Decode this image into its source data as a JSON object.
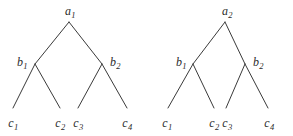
{
  "figure": {
    "type": "diagram",
    "background_color": "#ffffff",
    "line_color": "#3a3a3a",
    "text_color": "#2b2b2b",
    "width": 293,
    "height": 136
  },
  "trees": [
    {
      "id": "left-tree",
      "root": {
        "label": "a",
        "sub": "1",
        "x": 69,
        "y": 22,
        "label_x": 70,
        "label_y": 11
      },
      "internal": [
        {
          "label": "b",
          "sub": "1",
          "x": 35,
          "y": 64,
          "label_x": 22,
          "label_y": 62
        },
        {
          "label": "b",
          "sub": "2",
          "x": 102,
          "y": 64,
          "label_x": 115,
          "label_y": 62
        }
      ],
      "leaves": [
        {
          "label": "c",
          "sub": "1",
          "x": 13,
          "y": 108,
          "label_x": 13,
          "label_y": 123
        },
        {
          "label": "c",
          "sub": "2",
          "x": 60,
          "y": 108,
          "label_x": 60,
          "label_y": 123
        },
        {
          "label": "c",
          "sub": "3",
          "x": 78,
          "y": 108,
          "label_x": 78,
          "label_y": 123
        },
        {
          "label": "c",
          "sub": "4",
          "x": 127,
          "y": 108,
          "label_x": 127,
          "label_y": 123
        }
      ],
      "edges": [
        {
          "from": [
            69,
            22
          ],
          "to": [
            35,
            64
          ]
        },
        {
          "from": [
            69,
            22
          ],
          "to": [
            102,
            64
          ]
        },
        {
          "from": [
            35,
            64
          ],
          "to": [
            13,
            108
          ]
        },
        {
          "from": [
            35,
            64
          ],
          "to": [
            60,
            108
          ]
        },
        {
          "from": [
            102,
            64
          ],
          "to": [
            78,
            108
          ]
        },
        {
          "from": [
            102,
            64
          ],
          "to": [
            127,
            108
          ]
        }
      ]
    },
    {
      "id": "right-tree",
      "root": {
        "label": "a",
        "sub": "2",
        "x": 225,
        "y": 22,
        "label_x": 227,
        "label_y": 11
      },
      "internal": [
        {
          "label": "b",
          "sub": "1",
          "x": 193,
          "y": 64,
          "label_x": 181,
          "label_y": 62
        },
        {
          "label": "b",
          "sub": "2",
          "x": 245,
          "y": 64,
          "label_x": 258,
          "label_y": 62
        }
      ],
      "leaves": [
        {
          "label": "c",
          "sub": "1",
          "x": 168,
          "y": 108,
          "label_x": 167,
          "label_y": 123
        },
        {
          "label": "c",
          "sub": "2",
          "x": 214,
          "y": 108,
          "label_x": 214,
          "label_y": 123
        },
        {
          "label": "c",
          "sub": "3",
          "x": 226,
          "y": 108,
          "label_x": 227,
          "label_y": 123
        },
        {
          "label": "c",
          "sub": "4",
          "x": 268,
          "y": 108,
          "label_x": 269,
          "label_y": 123
        }
      ],
      "edges": [
        {
          "from": [
            225,
            22
          ],
          "to": [
            193,
            64
          ]
        },
        {
          "from": [
            225,
            22
          ],
          "to": [
            245,
            64
          ]
        },
        {
          "from": [
            193,
            64
          ],
          "to": [
            168,
            108
          ]
        },
        {
          "from": [
            193,
            64
          ],
          "to": [
            214,
            108
          ]
        },
        {
          "from": [
            245,
            64
          ],
          "to": [
            226,
            108
          ]
        },
        {
          "from": [
            245,
            64
          ],
          "to": [
            268,
            108
          ]
        }
      ]
    }
  ]
}
